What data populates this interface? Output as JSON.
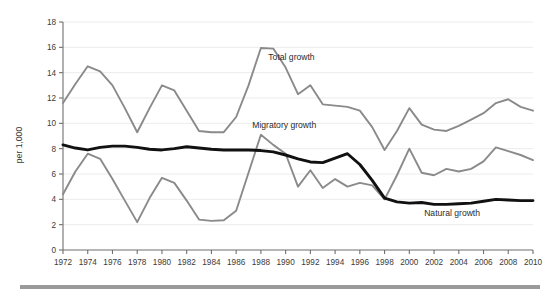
{
  "chart_data": {
    "type": "line",
    "title": "",
    "xlabel": "",
    "ylabel": "per 1,000",
    "xlim": [
      1972,
      2010
    ],
    "ylim": [
      0,
      18
    ],
    "grid": true,
    "legend_position": "inline-annotations",
    "x": [
      1972,
      1973,
      1974,
      1975,
      1976,
      1977,
      1978,
      1979,
      1980,
      1981,
      1982,
      1983,
      1984,
      1985,
      1986,
      1987,
      1988,
      1989,
      1990,
      1991,
      1992,
      1993,
      1994,
      1995,
      1996,
      1997,
      1998,
      1999,
      2000,
      2001,
      2002,
      2003,
      2004,
      2005,
      2006,
      2007,
      2008,
      2009,
      2010
    ],
    "xticks": [
      1972,
      1974,
      1976,
      1978,
      1980,
      1982,
      1984,
      1986,
      1988,
      1990,
      1992,
      1994,
      1996,
      1998,
      2000,
      2002,
      2004,
      2006,
      2008,
      2010
    ],
    "xtick_labels": [
      "1972",
      "1974",
      "1976",
      "1978",
      "1980",
      "1982",
      "1984",
      "1986",
      "1988",
      "1990",
      "1992",
      "1994",
      "1996",
      "1998",
      "2000",
      "2002",
      "2004",
      "2006",
      "2008",
      "2010"
    ],
    "yticks": [
      0,
      2,
      4,
      6,
      8,
      10,
      12,
      14,
      16,
      18
    ],
    "ytick_labels": [
      "0",
      "2",
      "4",
      "6",
      "8",
      "10",
      "12",
      "14",
      "16",
      "18"
    ],
    "series": [
      {
        "name": "Total growth",
        "color": "#8a8a8a",
        "width": 1.9,
        "label_x": 1988.6,
        "label_y": 15.0,
        "values": [
          11.6,
          13.1,
          14.5,
          14.1,
          13.0,
          11.2,
          9.3,
          11.2,
          13.0,
          12.6,
          11.0,
          9.4,
          9.3,
          9.3,
          10.5,
          13.0,
          15.95,
          15.9,
          14.4,
          12.3,
          13.0,
          11.5,
          11.4,
          11.3,
          11.0,
          9.7,
          7.9,
          9.4,
          11.2,
          9.9,
          9.5,
          9.4,
          9.8,
          10.3,
          10.8,
          11.6,
          11.9,
          11.3,
          11.0
        ]
      },
      {
        "name": "Migratory growth",
        "color": "#8a8a8a",
        "width": 1.9,
        "label_x": 1987.3,
        "label_y": 9.6,
        "values": [
          4.4,
          6.2,
          7.6,
          7.2,
          5.6,
          3.9,
          2.2,
          4.1,
          5.7,
          5.3,
          3.9,
          2.4,
          2.3,
          2.35,
          3.1,
          6.1,
          9.1,
          8.3,
          7.6,
          5.0,
          6.3,
          4.9,
          5.6,
          5.0,
          5.3,
          5.1,
          4.0,
          5.9,
          8.0,
          6.1,
          5.9,
          6.4,
          6.2,
          6.4,
          7.0,
          8.1,
          7.8,
          7.5,
          7.1
        ]
      },
      {
        "name": "Natural growth",
        "color": "#111111",
        "width": 2.9,
        "label_x": 2001.2,
        "label_y": 2.7,
        "values": [
          8.3,
          8.05,
          7.9,
          8.1,
          8.2,
          8.2,
          8.1,
          7.95,
          7.9,
          8.0,
          8.15,
          8.05,
          7.95,
          7.9,
          7.9,
          7.9,
          7.85,
          7.75,
          7.5,
          7.2,
          6.95,
          6.9,
          7.25,
          7.6,
          6.75,
          5.5,
          4.1,
          3.8,
          3.7,
          3.75,
          3.6,
          3.6,
          3.65,
          3.7,
          3.85,
          4.0,
          3.95,
          3.9,
          3.9
        ]
      }
    ],
    "annotations": [
      {
        "text": "Total growth"
      },
      {
        "text": "Migratory growth"
      },
      {
        "text": "Natural growth"
      }
    ]
  },
  "figure": {
    "y_axis_title": "per 1,000",
    "footer_rule_color": "#9a9a9a",
    "background": "#ffffff",
    "gridline_color": "#ececec",
    "axis_color": "#6f6f6f"
  }
}
